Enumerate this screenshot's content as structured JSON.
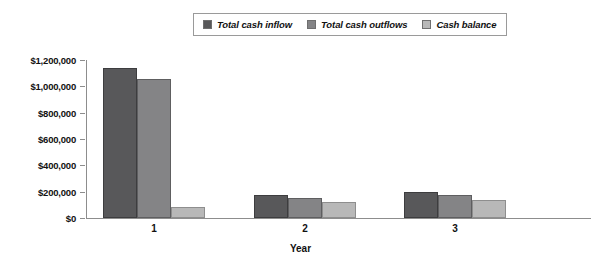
{
  "chart_data": {
    "type": "bar",
    "title": "",
    "subtitle": "",
    "xlabel": "Year",
    "ylabel": "",
    "categories": [
      "1",
      "2",
      "3"
    ],
    "series": [
      {
        "name": "Total cash inflow",
        "color": "#58585a",
        "values": [
          1140000,
          172000,
          196000
        ]
      },
      {
        "name": "Total cash outflows",
        "color": "#848486",
        "values": [
          1055000,
          150000,
          175000
        ]
      },
      {
        "name": "Cash balance",
        "color": "#b8b8b8",
        "values": [
          85000,
          118000,
          135000
        ]
      }
    ],
    "ylim": [
      0,
      1200000
    ],
    "ytick_values": [
      0,
      200000,
      400000,
      600000,
      800000,
      1000000,
      1200000
    ],
    "ytick_labels": [
      "$0",
      "$200,000",
      "$400,000",
      "$600,000",
      "$800,000",
      "$1,000,000",
      "$1,200,000"
    ],
    "grid": false,
    "legend_position": "top-center",
    "annotations": []
  },
  "legend": {
    "items": [
      {
        "label": "Total cash inflow",
        "color": "#58585a"
      },
      {
        "label": "Total cash outflows",
        "color": "#848486"
      },
      {
        "label": "Cash balance",
        "color": "#b8b8b8"
      }
    ]
  },
  "axes": {
    "x_title": "Year"
  }
}
